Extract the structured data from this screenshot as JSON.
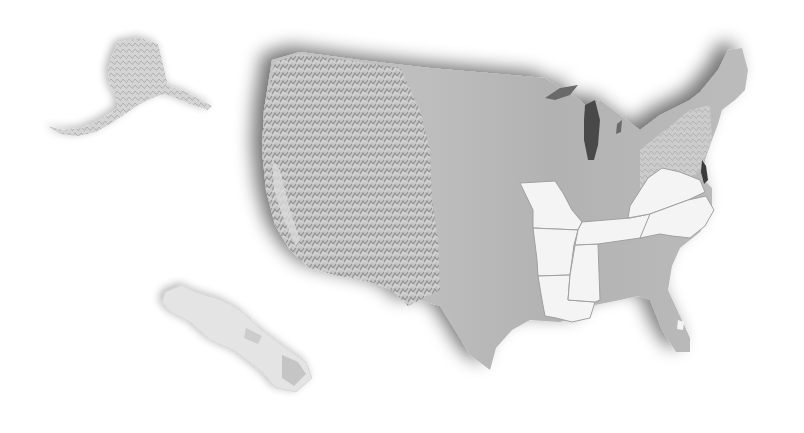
{
  "map": {
    "type": "shaded-relief",
    "region": "United States",
    "background": "#ffffff",
    "colors": {
      "land": "#b9b9b9",
      "land_light": "#d2d2d2",
      "mountains_dark": "#8a8a8a",
      "highlighted_states": "#f4f4f4",
      "state_border": "#a0a0a0",
      "shadow": "#6e6e6e",
      "lakes": "#4a4a4a"
    },
    "insets": [
      {
        "name": "Alaska",
        "position": "upper-left"
      },
      {
        "name": "Hawaii",
        "position": "lower-left"
      }
    ],
    "highlighted_states": [
      "Missouri",
      "Arkansas",
      "Louisiana",
      "Mississippi",
      "Tennessee",
      "Virginia",
      "West Virginia",
      "North Carolina"
    ]
  }
}
